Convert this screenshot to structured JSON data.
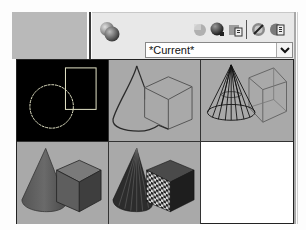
{
  "panel": {
    "title_icon": "material-spheres-icon",
    "toolbar": [
      {
        "name": "create-new-visual-style-icon",
        "tooltip": "Create New Visual Style"
      },
      {
        "name": "apply-to-viewport-icon",
        "tooltip": "Apply Selected Visual Style to Current Viewport"
      },
      {
        "name": "export-to-tool-palette-icon",
        "tooltip": "Export Selected Visual Style to Tool Palette"
      },
      {
        "name": "delete-visual-style-icon",
        "tooltip": "Delete Selected Visual Style"
      },
      {
        "name": "visual-style-manager-icon",
        "tooltip": "Visual Styles Manager"
      }
    ],
    "dropdown": {
      "value": "*Current*",
      "chevron": "chevron-down-icon"
    }
  },
  "visual_styles": [
    {
      "id": "2d-wireframe",
      "label": "2D Wireframe",
      "background": "#000000",
      "selected": true
    },
    {
      "id": "3d-hidden",
      "label": "3D Hidden",
      "background": "#a9a9a9"
    },
    {
      "id": "3d-wireframe",
      "label": "3D Wireframe",
      "background": "#a9a9a9"
    },
    {
      "id": "conceptual",
      "label": "Conceptual",
      "background": "#a9a9a9"
    },
    {
      "id": "realistic",
      "label": "Realistic",
      "background": "#a9a9a9"
    }
  ],
  "colors": {
    "panel_bg": "#e8e8e8",
    "thumb_bg": "#a9a9a9",
    "selected_bg": "#000000",
    "wire_light": "#e6e6c8"
  }
}
